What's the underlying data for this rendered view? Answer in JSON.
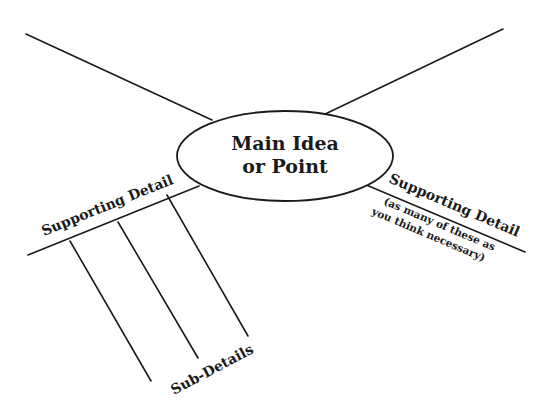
{
  "diagram": {
    "type": "spider-map",
    "main_idea": {
      "line1": "Main Idea",
      "line2": "or Point"
    },
    "branches": {
      "top_left": {
        "label": ""
      },
      "top_right": {
        "label": ""
      },
      "bottom_left": {
        "label": "Supporting Detail"
      },
      "bottom_right": {
        "label": "Supporting Detail",
        "note_line1": "(as many of these as",
        "note_line2": "you think necessary)"
      }
    },
    "sub_details_label": "Sub-Details",
    "colors": {
      "ink": "#1a1a1a",
      "background": "#ffffff"
    }
  }
}
